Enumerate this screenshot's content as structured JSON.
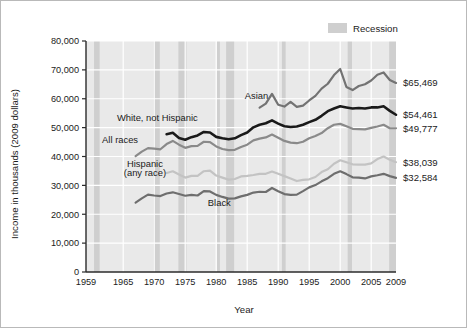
{
  "figure": {
    "background": "#ffffff",
    "border_color": "#b9b9b9"
  },
  "legend": {
    "position": "top-right",
    "entries": [
      {
        "label": "Recession",
        "swatch_color": "#cfcfcf",
        "name": "recession-swatch"
      }
    ]
  },
  "chart_data": {
    "type": "line",
    "title": "",
    "subtitle": "",
    "xlabel": "Year",
    "ylabel": "Income in thousands (2009 dollars)",
    "xlim": [
      1959,
      2009
    ],
    "ylim": [
      0,
      80000
    ],
    "grid": true,
    "grid_color": "#ffffff",
    "plot_background": "#e9e9e9",
    "xticks": [
      1959,
      1965,
      1970,
      1975,
      1980,
      1985,
      1990,
      1995,
      2000,
      2005,
      2009
    ],
    "xtick_labels": [
      "1959",
      "1965",
      "1970",
      "1975",
      "1980",
      "1985",
      "1990",
      "1995",
      "2000",
      "2005",
      "2009"
    ],
    "yticks": [
      0,
      10000,
      20000,
      30000,
      40000,
      50000,
      60000,
      70000,
      80000
    ],
    "ytick_labels": [
      "0",
      "10,000",
      "20,000",
      "30,000",
      "40,000",
      "50,000",
      "60,000",
      "70,000",
      "80,000"
    ],
    "legend_position": "top-right",
    "recession_bands": [
      {
        "start": 1960.3,
        "end": 1961.2
      },
      {
        "start": 1969.9,
        "end": 1970.9
      },
      {
        "start": 1973.9,
        "end": 1975.2
      },
      {
        "start": 1980.1,
        "end": 1980.6
      },
      {
        "start": 1981.6,
        "end": 1982.9
      },
      {
        "start": 1990.6,
        "end": 1991.2
      },
      {
        "start": 2001.2,
        "end": 2001.9
      },
      {
        "start": 2007.9,
        "end": 2009.5
      }
    ],
    "series": [
      {
        "name": "Asian",
        "color": "#737373",
        "width": 2.2,
        "end_label": "$65,469",
        "label_x": 1986.5,
        "label_y": 59800,
        "x": [
          1987,
          1988,
          1989,
          1990,
          1991,
          1992,
          1993,
          1994,
          1995,
          1996,
          1997,
          1998,
          1999,
          2000,
          2001,
          2002,
          2003,
          2004,
          2005,
          2006,
          2007,
          2008,
          2009
        ],
        "values": [
          56900,
          58300,
          61700,
          57900,
          57300,
          58900,
          57200,
          57600,
          59400,
          61000,
          63500,
          65200,
          68200,
          70300,
          64100,
          63000,
          64400,
          65000,
          66300,
          68300,
          69100,
          66500,
          65469
        ]
      },
      {
        "name": "White, not Hispanic",
        "color": "#1a1a1a",
        "width": 2.6,
        "end_label": "$54,461",
        "label_x": 1970.5,
        "label_y": 52400,
        "x": [
          1972,
          1973,
          1974,
          1975,
          1976,
          1977,
          1978,
          1979,
          1980,
          1981,
          1982,
          1983,
          1984,
          1985,
          1986,
          1987,
          1988,
          1989,
          1990,
          1991,
          1992,
          1993,
          1994,
          1995,
          1996,
          1997,
          1998,
          1999,
          2000,
          2001,
          2002,
          2003,
          2004,
          2005,
          2006,
          2007,
          2008,
          2009
        ],
        "values": [
          47700,
          48200,
          46400,
          45800,
          46700,
          47300,
          48500,
          48300,
          46800,
          46300,
          46000,
          46300,
          47400,
          48300,
          50100,
          51000,
          51500,
          52500,
          51400,
          50500,
          50200,
          50400,
          51000,
          51900,
          52700,
          54100,
          55700,
          56600,
          57400,
          57000,
          56600,
          56800,
          56600,
          57000,
          57000,
          57400,
          55800,
          54461
        ]
      },
      {
        "name": "All races",
        "color": "#8a8a8a",
        "width": 2.2,
        "end_label": "$49,777",
        "label_x": 1964.5,
        "label_y": 44800,
        "x": [
          1967,
          1968,
          1969,
          1970,
          1971,
          1972,
          1973,
          1974,
          1975,
          1976,
          1977,
          1978,
          1979,
          1980,
          1981,
          1982,
          1983,
          1984,
          1985,
          1986,
          1987,
          1988,
          1989,
          1990,
          1991,
          1992,
          1993,
          1994,
          1995,
          1996,
          1997,
          1998,
          1999,
          2000,
          2001,
          2002,
          2003,
          2004,
          2005,
          2006,
          2007,
          2008,
          2009
        ],
        "values": [
          40100,
          41700,
          42900,
          42700,
          42500,
          44300,
          45400,
          44100,
          43000,
          43600,
          43700,
          45100,
          45000,
          43500,
          42600,
          42200,
          42300,
          43300,
          44100,
          45600,
          46200,
          46600,
          47600,
          46500,
          45400,
          44800,
          44600,
          45100,
          46300,
          47100,
          48100,
          49800,
          51000,
          51300,
          50500,
          49600,
          49500,
          49400,
          49900,
          50400,
          51000,
          49800,
          49777
        ]
      },
      {
        "name": "Hispanic (any race)",
        "color": "#c3c3c3",
        "width": 2.2,
        "end_label": "$38,039",
        "label_x": 1968.5,
        "label_y": 36200,
        "label_line2_y": 33200,
        "x": [
          1972,
          1973,
          1974,
          1975,
          1976,
          1977,
          1978,
          1979,
          1980,
          1981,
          1982,
          1983,
          1984,
          1985,
          1986,
          1987,
          1988,
          1989,
          1990,
          1991,
          1992,
          1993,
          1994,
          1995,
          1996,
          1997,
          1998,
          1999,
          2000,
          2001,
          2002,
          2003,
          2004,
          2005,
          2006,
          2007,
          2008,
          2009
        ],
        "values": [
          34300,
          34900,
          33800,
          32700,
          33300,
          33300,
          34900,
          35100,
          33400,
          32700,
          32000,
          32200,
          33100,
          33300,
          33600,
          34000,
          34000,
          34800,
          34000,
          33200,
          32400,
          31500,
          31900,
          32100,
          32900,
          34600,
          35600,
          37500,
          38700,
          38000,
          37300,
          37200,
          37200,
          37600,
          39100,
          40000,
          38900,
          38039
        ]
      },
      {
        "name": "Black",
        "color": "#6e6e6e",
        "width": 2.2,
        "end_label": "$32,584",
        "label_x": 1980.5,
        "label_y": 22900,
        "x": [
          1967,
          1968,
          1969,
          1970,
          1971,
          1972,
          1973,
          1974,
          1975,
          1976,
          1977,
          1978,
          1979,
          1980,
          1981,
          1982,
          1983,
          1984,
          1985,
          1986,
          1987,
          1988,
          1989,
          1990,
          1991,
          1992,
          1993,
          1994,
          1995,
          1996,
          1997,
          1998,
          1999,
          2000,
          2001,
          2002,
          2003,
          2004,
          2005,
          2006,
          2007,
          2008,
          2009
        ],
        "values": [
          24000,
          25500,
          26800,
          26500,
          26300,
          27200,
          27600,
          27000,
          26400,
          26700,
          26500,
          28000,
          27900,
          26700,
          26000,
          25400,
          25500,
          26200,
          26700,
          27500,
          27800,
          27700,
          29100,
          28000,
          27000,
          26700,
          26800,
          28000,
          29300,
          30100,
          31400,
          32500,
          34000,
          34900,
          33900,
          32800,
          32700,
          32400,
          33100,
          33500,
          34000,
          33200,
          32584
        ]
      }
    ]
  }
}
